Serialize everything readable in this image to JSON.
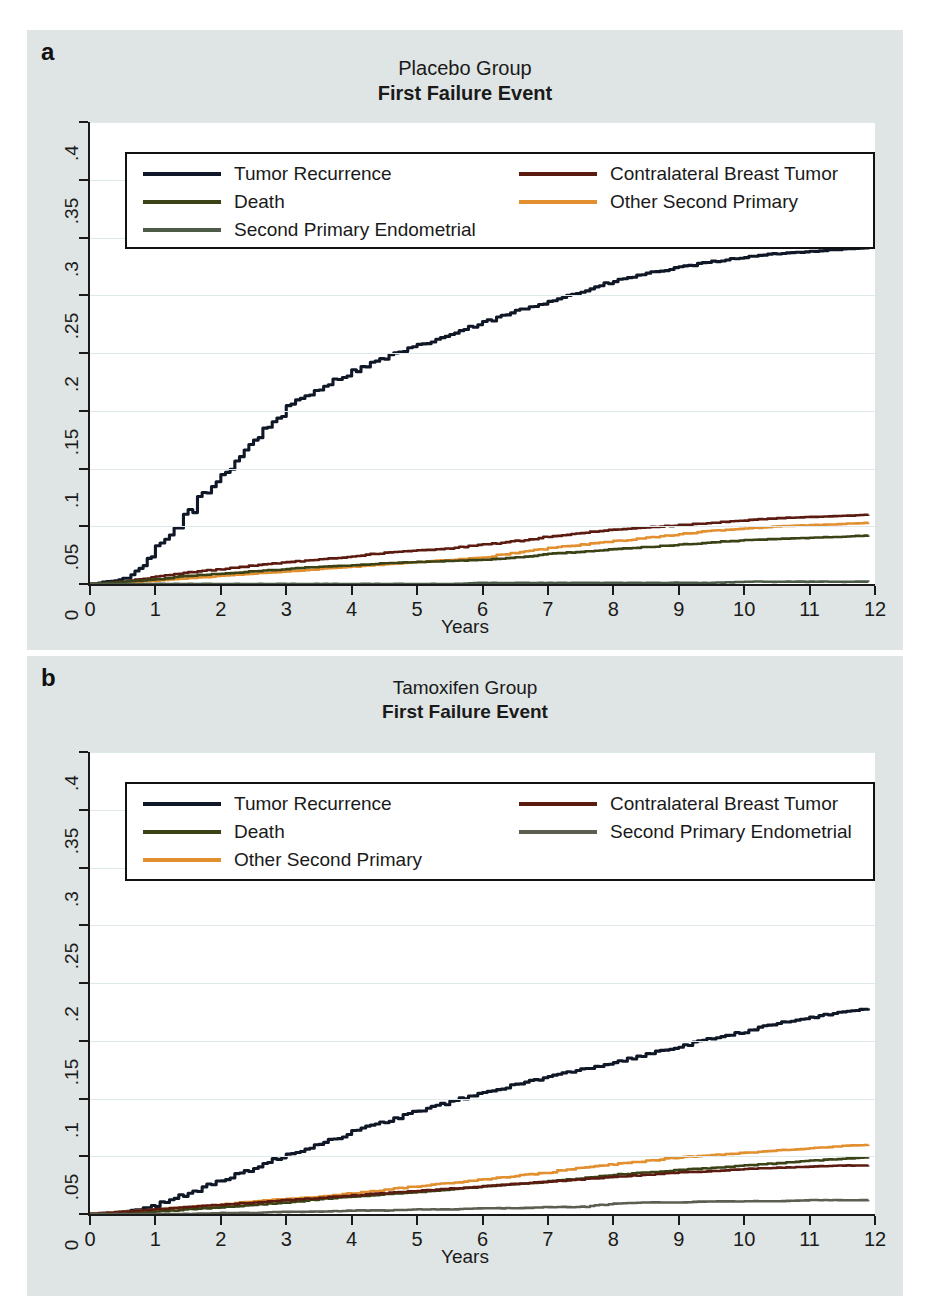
{
  "figure": {
    "panels": [
      {
        "letter": "a",
        "title_line1": "Placebo Group",
        "title_line2": "First Failure Event",
        "xlabel": "Years",
        "legend_layout": "3-left-2-right",
        "legend_left": [
          {
            "label": "Tumor Recurrence",
            "color": "#101828"
          },
          {
            "label": "Death",
            "color": "#3b4316"
          },
          {
            "label": "Second Primary Endometrial",
            "color": "#4c5a48"
          }
        ],
        "legend_right": [
          {
            "label": "Contralateral Breast Tumor",
            "color": "#5c1b10"
          },
          {
            "label": "Other Second Primary",
            "color": "#e2902f"
          }
        ]
      },
      {
        "letter": "b",
        "title_line1": "Tamoxifen Group",
        "title_line2": "First Failure Event",
        "xlabel": "Years",
        "legend_layout": "3-left-2-right",
        "legend_left": [
          {
            "label": "Tumor Recurrence",
            "color": "#101828"
          },
          {
            "label": "Death",
            "color": "#3b4316"
          },
          {
            "label": "Other Second Primary",
            "color": "#e2902f"
          }
        ],
        "legend_right": [
          {
            "label": "Contralateral Breast Tumor",
            "color": "#5c1b10"
          },
          {
            "label": "Second Primary Endometrial",
            "color": "#5b5e50"
          }
        ]
      }
    ]
  },
  "axis": {
    "yticks": [
      "0",
      ".05",
      ".1",
      ".15",
      ".2",
      ".25",
      ".3",
      ".35",
      ".4"
    ],
    "ytick_values": [
      0,
      0.05,
      0.1,
      0.15,
      0.2,
      0.25,
      0.3,
      0.35,
      0.4
    ],
    "xticks": [
      "0",
      "1",
      "2",
      "3",
      "4",
      "5",
      "6",
      "7",
      "8",
      "9",
      "10",
      "11",
      "12"
    ],
    "xtick_values": [
      0,
      1,
      2,
      3,
      4,
      5,
      6,
      7,
      8,
      9,
      10,
      11,
      12
    ]
  },
  "chart_data": [
    {
      "type": "line",
      "title": "Placebo Group — First Failure Event",
      "xlabel": "Years",
      "ylabel": "",
      "xlim": [
        0,
        12
      ],
      "ylim": [
        0,
        0.4
      ],
      "grid": true,
      "legend_position": "top-inside",
      "x": [
        0,
        0.25,
        0.5,
        0.75,
        1,
        1.5,
        2,
        2.5,
        3,
        3.5,
        4,
        4.5,
        5,
        5.5,
        6,
        6.5,
        7,
        7.5,
        8,
        8.5,
        9,
        9.5,
        10,
        10.5,
        11,
        11.5,
        11.9
      ],
      "series": [
        {
          "name": "Tumor Recurrence",
          "color": "#101828",
          "values": [
            0,
            0.002,
            0.004,
            0.012,
            0.028,
            0.062,
            0.094,
            0.125,
            0.152,
            0.17,
            0.184,
            0.196,
            0.206,
            0.216,
            0.226,
            0.236,
            0.245,
            0.253,
            0.262,
            0.269,
            0.274,
            0.279,
            0.283,
            0.286,
            0.288,
            0.29,
            0.291
          ]
        },
        {
          "name": "Contralateral Breast Tumor",
          "color": "#5c1b10",
          "values": [
            0,
            0.001,
            0.002,
            0.004,
            0.006,
            0.01,
            0.013,
            0.016,
            0.019,
            0.021,
            0.024,
            0.027,
            0.029,
            0.031,
            0.034,
            0.037,
            0.041,
            0.044,
            0.047,
            0.049,
            0.051,
            0.053,
            0.055,
            0.057,
            0.058,
            0.059,
            0.06
          ]
        },
        {
          "name": "Other Second Primary",
          "color": "#e2902f",
          "values": [
            0,
            0.0,
            0.001,
            0.002,
            0.003,
            0.005,
            0.007,
            0.009,
            0.011,
            0.013,
            0.015,
            0.017,
            0.019,
            0.021,
            0.023,
            0.027,
            0.031,
            0.034,
            0.037,
            0.04,
            0.043,
            0.046,
            0.048,
            0.05,
            0.051,
            0.052,
            0.053
          ]
        },
        {
          "name": "Death",
          "color": "#3b4316",
          "values": [
            0,
            0.001,
            0.002,
            0.003,
            0.004,
            0.007,
            0.009,
            0.011,
            0.013,
            0.015,
            0.016,
            0.018,
            0.019,
            0.02,
            0.021,
            0.023,
            0.026,
            0.028,
            0.03,
            0.032,
            0.034,
            0.036,
            0.038,
            0.039,
            0.04,
            0.041,
            0.042
          ]
        },
        {
          "name": "Second Primary Endometrial",
          "color": "#4c5a48",
          "values": [
            0,
            0.0,
            0.0,
            0.0,
            0.0,
            0.0,
            0.0,
            0.0,
            0.0,
            0.0,
            0.0,
            0.0,
            0.0,
            0.0,
            0.001,
            0.001,
            0.001,
            0.001,
            0.001,
            0.001,
            0.001,
            0.001,
            0.002,
            0.002,
            0.002,
            0.002,
            0.002
          ]
        }
      ]
    },
    {
      "type": "line",
      "title": "Tamoxifen Group — First Failure Event",
      "xlabel": "Years",
      "ylabel": "",
      "xlim": [
        0,
        12
      ],
      "ylim": [
        0,
        0.4
      ],
      "grid": true,
      "legend_position": "top-inside",
      "x": [
        0,
        0.25,
        0.5,
        0.75,
        1,
        1.5,
        2,
        2.5,
        3,
        3.5,
        4,
        4.5,
        5,
        5.5,
        6,
        6.5,
        7,
        7.5,
        8,
        8.5,
        9,
        9.5,
        10,
        10.5,
        11,
        11.5,
        11.9
      ],
      "series": [
        {
          "name": "Tumor Recurrence",
          "color": "#101828",
          "values": [
            0,
            0.001,
            0.002,
            0.004,
            0.008,
            0.018,
            0.029,
            0.04,
            0.051,
            0.061,
            0.071,
            0.08,
            0.089,
            0.097,
            0.105,
            0.112,
            0.119,
            0.125,
            0.131,
            0.138,
            0.145,
            0.152,
            0.158,
            0.165,
            0.17,
            0.175,
            0.178
          ]
        },
        {
          "name": "Other Second Primary",
          "color": "#e2902f",
          "values": [
            0,
            0.001,
            0.002,
            0.003,
            0.004,
            0.006,
            0.008,
            0.011,
            0.013,
            0.015,
            0.018,
            0.021,
            0.024,
            0.027,
            0.03,
            0.033,
            0.036,
            0.04,
            0.043,
            0.046,
            0.049,
            0.051,
            0.053,
            0.055,
            0.057,
            0.059,
            0.06
          ]
        },
        {
          "name": "Death",
          "color": "#3b4316",
          "values": [
            0,
            0.0,
            0.001,
            0.001,
            0.002,
            0.004,
            0.006,
            0.008,
            0.01,
            0.013,
            0.015,
            0.017,
            0.019,
            0.021,
            0.024,
            0.026,
            0.028,
            0.031,
            0.034,
            0.036,
            0.038,
            0.04,
            0.042,
            0.044,
            0.046,
            0.048,
            0.049
          ]
        },
        {
          "name": "Contralateral Breast Tumor",
          "color": "#5c1b10",
          "values": [
            0,
            0.001,
            0.002,
            0.003,
            0.004,
            0.006,
            0.008,
            0.01,
            0.012,
            0.014,
            0.016,
            0.018,
            0.02,
            0.022,
            0.024,
            0.026,
            0.028,
            0.03,
            0.032,
            0.034,
            0.036,
            0.037,
            0.039,
            0.04,
            0.041,
            0.042,
            0.042
          ]
        },
        {
          "name": "Second Primary Endometrial",
          "color": "#5b5e50",
          "values": [
            0,
            0.0,
            0.0,
            0.0,
            0.0,
            0.0,
            0.001,
            0.001,
            0.002,
            0.002,
            0.003,
            0.003,
            0.004,
            0.004,
            0.005,
            0.005,
            0.006,
            0.006,
            0.009,
            0.01,
            0.01,
            0.011,
            0.011,
            0.011,
            0.012,
            0.012,
            0.012
          ]
        }
      ]
    }
  ]
}
